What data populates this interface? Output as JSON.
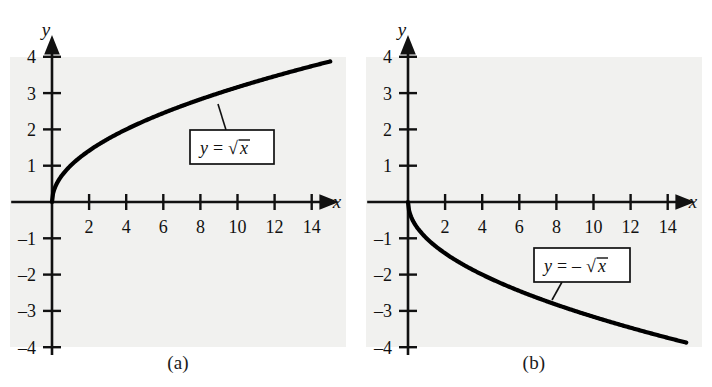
{
  "figure": {
    "background_color": "#ffffff",
    "panel_background_color": "#f1f1ef",
    "ink_color": "#111111",
    "curve_color": "#000000"
  },
  "panels": [
    {
      "id": "a",
      "caption": "(a)",
      "equation_label": {
        "lhs": "y",
        "equals": "=",
        "sign": "",
        "radical": "√",
        "radicand": "x",
        "full_text": "y = √x"
      }
    },
    {
      "id": "b",
      "caption": "(b)",
      "equation_label": {
        "lhs": "y",
        "equals": "=",
        "sign": "–",
        "radical": "√",
        "radicand": "x",
        "full_text": "y = – √x"
      }
    }
  ],
  "chart_data": [
    {
      "type": "line",
      "title": "",
      "subtitle": "",
      "panel_id": "a",
      "caption": "(a)",
      "xlabel": "x",
      "ylabel": "y",
      "function": "y = sqrt(x)",
      "annotations": [
        "y = √x"
      ],
      "legend_position": "none",
      "grid": false,
      "xlim": [
        -1,
        15.6
      ],
      "ylim": [
        -4.6,
        4.6
      ],
      "xticks": [
        2,
        4,
        6,
        8,
        10,
        12,
        14
      ],
      "yticks": [
        4,
        3,
        2,
        1,
        -1,
        -2,
        -3,
        -4
      ],
      "xtick_labels": [
        "2",
        "4",
        "6",
        "8",
        "10",
        "12",
        "14"
      ],
      "ytick_labels": [
        "4",
        "3",
        "2",
        "1",
        "–1",
        "–2",
        "–3",
        "–4"
      ],
      "x": [
        0,
        0.25,
        0.5,
        1,
        1.5,
        2,
        3,
        4,
        5,
        6,
        7,
        8,
        9,
        10,
        11,
        12,
        13,
        14,
        15
      ],
      "y": [
        0,
        0.5,
        0.707,
        1,
        1.225,
        1.414,
        1.732,
        2,
        2.236,
        2.449,
        2.646,
        2.828,
        3,
        3.162,
        3.317,
        3.464,
        3.606,
        3.742,
        3.873
      ]
    },
    {
      "type": "line",
      "title": "",
      "subtitle": "",
      "panel_id": "b",
      "caption": "(b)",
      "xlabel": "x",
      "ylabel": "y",
      "function": "y = -sqrt(x)",
      "annotations": [
        "y = – √x"
      ],
      "legend_position": "none",
      "grid": false,
      "xlim": [
        -1,
        15.6
      ],
      "ylim": [
        -4.6,
        4.6
      ],
      "xticks": [
        2,
        4,
        6,
        8,
        10,
        12,
        14
      ],
      "yticks": [
        4,
        3,
        2,
        1,
        -1,
        -2,
        -3,
        -4
      ],
      "xtick_labels": [
        "2",
        "4",
        "6",
        "8",
        "10",
        "12",
        "14"
      ],
      "ytick_labels": [
        "4",
        "3",
        "2",
        "1",
        "–1",
        "–2",
        "–3",
        "–4"
      ],
      "x": [
        0,
        0.25,
        0.5,
        1,
        1.5,
        2,
        3,
        4,
        5,
        6,
        7,
        8,
        9,
        10,
        11,
        12,
        13,
        14,
        15
      ],
      "y": [
        0,
        -0.5,
        -0.707,
        -1,
        -1.225,
        -1.414,
        -1.732,
        -2,
        -2.236,
        -2.449,
        -2.646,
        -2.828,
        -3,
        -3.162,
        -3.317,
        -3.464,
        -3.606,
        -3.742,
        -3.873
      ]
    }
  ]
}
